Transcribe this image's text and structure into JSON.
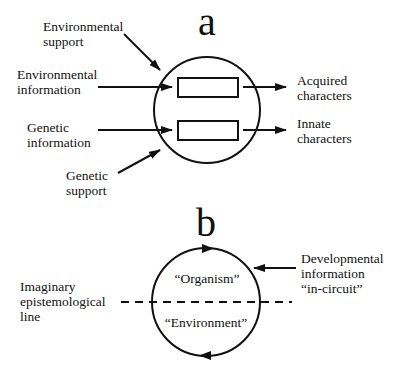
{
  "panel_a": {
    "letter": "a",
    "inputs": {
      "environmental_support": [
        "Environmental",
        "support"
      ],
      "environmental_information": [
        "Environmental",
        "information"
      ],
      "genetic_information": [
        "Genetic",
        "information"
      ],
      "genetic_support": [
        "Genetic",
        "support"
      ]
    },
    "outputs": {
      "acquired_characters": [
        "Acquired",
        "characters"
      ],
      "innate_characters": [
        "Innate",
        "characters"
      ]
    }
  },
  "panel_b": {
    "letter": "b",
    "left_label": [
      "Imaginary",
      "epistemological",
      "line"
    ],
    "right_label": [
      "Developmental",
      "information",
      "“in-circuit”"
    ],
    "upper_region": "“Organism”",
    "lower_region": "“Environment”"
  },
  "colors": {
    "stroke": "#111111",
    "background": "#ffffff"
  }
}
